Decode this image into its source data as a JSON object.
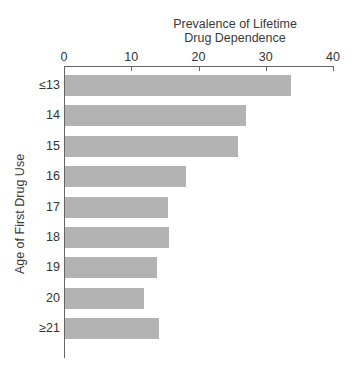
{
  "chart_data": {
    "type": "bar",
    "orientation": "horizontal",
    "title_lines": [
      "Prevalence of Lifetime",
      "Drug Dependence"
    ],
    "xlabel": "Prevalence of Lifetime Drug Dependence",
    "ylabel": "Age of First Drug Use",
    "categories": [
      "≤13",
      "14",
      "15",
      "16",
      "17",
      "18",
      "19",
      "20",
      "≥21"
    ],
    "values": [
      33.6,
      26.9,
      25.7,
      18.0,
      15.3,
      15.4,
      13.7,
      11.7,
      14.0
    ],
    "xlim": [
      0,
      40
    ],
    "xticks": [
      "0",
      "10",
      "20",
      "30",
      "40"
    ],
    "x_axis_position": "top",
    "grid": false,
    "legend": null,
    "bar_color": "#b3b3b3"
  }
}
